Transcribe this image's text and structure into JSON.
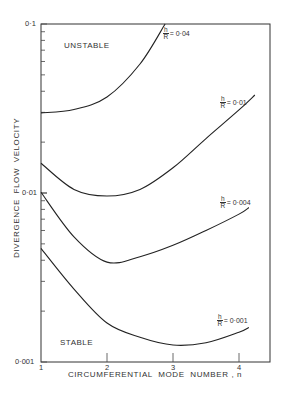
{
  "chart_data": {
    "type": "line",
    "title": "",
    "xlabel": "CIRCUMFERENTIAL  MODE  NUMBER , n",
    "ylabel": "DIVERGENCE  FLOW  VELOCITY",
    "y_scale": "log",
    "ylim": [
      0.001,
      0.1
    ],
    "xlim": [
      1,
      4.5
    ],
    "x_ticks": [
      "1",
      "2",
      "3",
      "4"
    ],
    "y_ticks": [
      "0·1",
      "0·01",
      "0·001"
    ],
    "grid": false,
    "legend": "inline curve labels",
    "annotations": [
      "UNSTABLE",
      "STABLE"
    ],
    "series": [
      {
        "name": "h/R = 0·04",
        "label_frac_num": "h",
        "label_frac_den": "R",
        "label_value": "= 0·04",
        "x": [
          1.0,
          1.5,
          2.0,
          2.5,
          2.88
        ],
        "y": [
          0.0298,
          0.0312,
          0.037,
          0.058,
          0.1
        ]
      },
      {
        "name": "h/R = 0·01",
        "label_frac_num": "h",
        "label_frac_den": "R",
        "label_value": "= 0·01",
        "x": [
          1.0,
          1.5,
          2.0,
          2.5,
          3.0,
          3.5,
          4.0,
          4.24
        ],
        "y": [
          0.015,
          0.0105,
          0.0096,
          0.0105,
          0.0141,
          0.021,
          0.031,
          0.038
        ]
      },
      {
        "name": "h/R = 0·004",
        "label_frac_num": "h",
        "label_frac_den": "R",
        "label_value": "= 0·004",
        "x": [
          1.0,
          1.5,
          2.0,
          2.5,
          3.0,
          3.5,
          4.0,
          4.15
        ],
        "y": [
          0.0101,
          0.0055,
          0.0039,
          0.0042,
          0.0049,
          0.006,
          0.0075,
          0.0082
        ]
      },
      {
        "name": "h/R = 0·001",
        "label_frac_num": "h",
        "label_frac_den": "R",
        "label_value": "= 0·001",
        "x": [
          1.0,
          1.5,
          2.0,
          2.5,
          3.0,
          3.5,
          4.0,
          4.15
        ],
        "y": [
          0.0047,
          0.0027,
          0.0017,
          0.0014,
          0.00126,
          0.0013,
          0.0015,
          0.0016
        ]
      }
    ]
  },
  "labels": {
    "unstable": "UNSTABLE",
    "stable": "STABLE",
    "y_axis": "DIVERGENCE  FLOW  VELOCITY",
    "x_axis": "CIRCUMFERENTIAL  MODE  NUMBER , n",
    "ytick_01": "0·1",
    "ytick_001": "0·01",
    "ytick_0001": "0·001",
    "xtick_1": "1",
    "xtick_2": "2",
    "xtick_3": "3",
    "xtick_4": "4"
  },
  "curve_labels": [
    {
      "num": "h",
      "den": "R",
      "value": "= 0·04"
    },
    {
      "num": "h",
      "den": "R",
      "value": "= 0·01"
    },
    {
      "num": "h",
      "den": "R",
      "value": "= 0·004"
    },
    {
      "num": "h",
      "den": "R",
      "value": "= 0·001"
    }
  ]
}
